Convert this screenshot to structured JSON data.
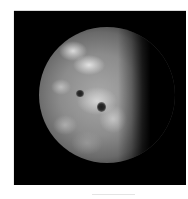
{
  "image": {
    "subject": "gibbous moon with cratered surface",
    "background_color": "#000000",
    "page_background": "#ffffff",
    "features": [
      {
        "type": "bright-patch",
        "position": [
          68,
          49
        ]
      },
      {
        "type": "bright-patch",
        "position": [
          83,
          63
        ]
      },
      {
        "type": "crater",
        "position": [
          80,
          94
        ]
      },
      {
        "type": "crater",
        "position": [
          101,
          107
        ]
      }
    ]
  }
}
